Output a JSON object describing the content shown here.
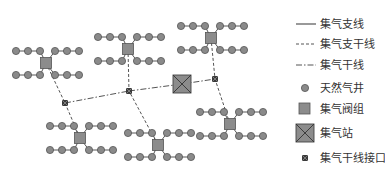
{
  "diagram": {
    "title": "",
    "colors": {
      "well": "#8a8a8a",
      "well_stroke": "#555555",
      "valve": "#8c8c8c",
      "valve_stroke": "#555555",
      "station": "#8c8c8c",
      "junction": "#3a3a3a",
      "line": "#555555"
    },
    "legend": [
      {
        "key": "branch_line",
        "label": "集气支线",
        "symbol": "solid-line"
      },
      {
        "key": "sub_trunk_line",
        "label": "集气支干线",
        "symbol": "dashed-line"
      },
      {
        "key": "trunk_line",
        "label": "集气干线",
        "symbol": "dash-dot-line"
      },
      {
        "key": "gas_well",
        "label": "天然气井",
        "symbol": "circle"
      },
      {
        "key": "valve_group",
        "label": "集气阀组",
        "symbol": "square"
      },
      {
        "key": "gathering_station",
        "label": "集气站",
        "symbol": "crossed-square"
      },
      {
        "key": "trunk_interface",
        "label": "集气干线接口",
        "symbol": "small-crossed-square"
      }
    ],
    "nodes": {
      "station": {
        "id": "station",
        "type": "gathering_station"
      },
      "junctions": [
        {
          "id": "J1",
          "type": "trunk_interface"
        },
        {
          "id": "J2",
          "type": "trunk_interface"
        },
        {
          "id": "J3",
          "type": "trunk_interface"
        }
      ],
      "clusters": [
        {
          "id": "A",
          "type": "valve_group",
          "wells_per_row": 3,
          "rows": 2,
          "connects_to": "J1"
        },
        {
          "id": "B",
          "type": "valve_group",
          "wells_per_row": 3,
          "rows": 2,
          "connects_to": "J2"
        },
        {
          "id": "C",
          "type": "valve_group",
          "wells_per_row": 3,
          "rows": 2,
          "connects_to": "J3"
        },
        {
          "id": "D",
          "type": "valve_group",
          "wells_per_row": 3,
          "rows": 2,
          "connects_to": "J1"
        },
        {
          "id": "E",
          "type": "valve_group",
          "wells_per_row": 3,
          "rows": 2,
          "connects_to": "J2"
        },
        {
          "id": "F",
          "type": "valve_group",
          "wells_per_row": 3,
          "rows": 2,
          "connects_to": "J3"
        }
      ]
    },
    "edges": {
      "trunk": [
        [
          "J1",
          "J2"
        ],
        [
          "J2",
          "station"
        ],
        [
          "station",
          "J3"
        ]
      ]
    }
  }
}
